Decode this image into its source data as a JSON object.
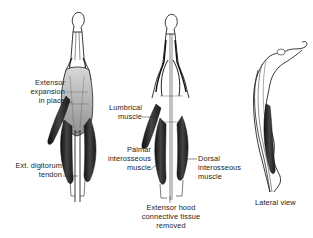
{
  "figure": {
    "type": "anatomical-illustration",
    "panels": [
      {
        "id": "dorsal-view-intact",
        "labels": [
          {
            "lines": [
              "Extensor",
              "expansion",
              "in place"
            ]
          },
          {
            "lines": [
              "Ext. digitorum",
              "tendon"
            ]
          }
        ]
      },
      {
        "id": "dorsal-view-hood-removed",
        "labels": [
          {
            "lines": [
              "Lumbrical",
              "muscle"
            ]
          },
          {
            "lines": [
              "Palmar",
              "interosseous",
              "muscle"
            ]
          },
          {
            "lines": [
              "Dorsal",
              "interosseous",
              "muscle"
            ]
          },
          {
            "lines": [
              "Extensor hood",
              "connective tissue",
              "removed"
            ]
          }
        ]
      },
      {
        "id": "lateral-view",
        "labels": [
          {
            "lines": [
              "Lateral view"
            ]
          }
        ]
      }
    ]
  },
  "colors": {
    "background": "#ffffff",
    "ink": "#1a1a1a",
    "muscle_dark": "#2a2a2a",
    "tendon_shade": "#bdbdbd",
    "expansion_shade": "#9a9a9a"
  }
}
